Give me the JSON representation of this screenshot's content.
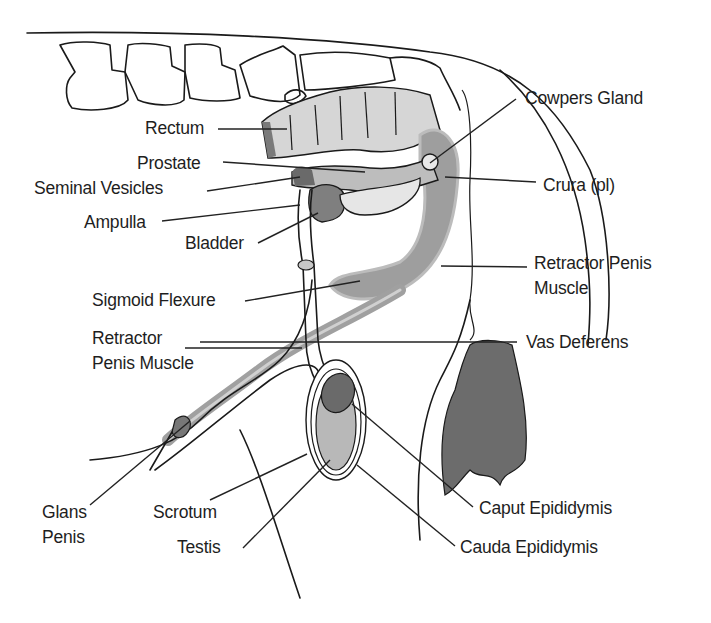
{
  "diagram": {
    "colors": {
      "background": "#ffffff",
      "ink": "#1a1a1a",
      "light_tissue": "#d9d9d9",
      "mid_tissue": "#a8a8a8",
      "dark_tissue": "#6e6e6e",
      "hair": "#6a6a6a"
    },
    "labels": [
      {
        "id": "rectum",
        "text": "Rectum",
        "x": 145,
        "y": 116,
        "align": "left",
        "line": [
          218,
          129,
          287,
          129
        ]
      },
      {
        "id": "prostate",
        "text": "Prostate",
        "x": 137,
        "y": 151,
        "align": "left",
        "line": [
          223,
          162,
          365,
          172
        ]
      },
      {
        "id": "seminal-vesicles",
        "text": "Seminal Vesicles",
        "x": 34,
        "y": 176,
        "align": "left",
        "line": [
          207,
          191,
          300,
          177
        ]
      },
      {
        "id": "ampulla",
        "text": "Ampulla",
        "x": 84,
        "y": 210,
        "align": "left",
        "line": [
          162,
          221,
          300,
          205
        ]
      },
      {
        "id": "bladder",
        "text": "Bladder",
        "x": 185,
        "y": 231,
        "align": "left",
        "line": [
          258,
          243,
          318,
          213
        ]
      },
      {
        "id": "cowpers-gland",
        "text": "Cowpers Gland",
        "x": 525,
        "y": 86,
        "align": "left",
        "line": [
          516,
          99,
          430,
          163
        ]
      },
      {
        "id": "crura",
        "text": "Crura (pl)",
        "x": 543,
        "y": 173,
        "align": "left",
        "line": [
          536,
          182,
          445,
          177
        ]
      },
      {
        "id": "retractor-penis-muscle-right",
        "text": "Retractor Penis\nMuscle",
        "x": 534,
        "y": 251,
        "align": "left",
        "line": [
          527,
          267,
          441,
          266
        ]
      },
      {
        "id": "sigmoid-flexure",
        "text": "Sigmoid Flexure",
        "x": 92,
        "y": 288,
        "align": "left",
        "line": [
          245,
          301,
          360,
          281
        ]
      },
      {
        "id": "retractor-penis-muscle-left",
        "text": "Retractor\nPenis Muscle",
        "x": 92,
        "y": 326,
        "align": "left",
        "line": [
          185,
          348,
          302,
          348
        ]
      },
      {
        "id": "vas-deferens",
        "text": "Vas Deferens",
        "x": 526,
        "y": 330,
        "align": "left",
        "line": [
          517,
          342,
          200,
          342
        ]
      },
      {
        "id": "glans-penis",
        "text": "Glans\nPenis",
        "x": 42,
        "y": 500,
        "align": "left",
        "line": [
          90,
          505,
          190,
          421
        ]
      },
      {
        "id": "scrotum",
        "text": "Scrotum",
        "x": 153,
        "y": 500,
        "align": "left",
        "line": [
          210,
          500,
          307,
          454
        ]
      },
      {
        "id": "testis",
        "text": "Testis",
        "x": 177,
        "y": 535,
        "align": "left",
        "line": [
          243,
          548,
          330,
          460
        ]
      },
      {
        "id": "caput-epididymis",
        "text": "Caput Epididymis",
        "x": 479,
        "y": 496,
        "align": "left",
        "line": [
          473,
          507,
          352,
          404
        ]
      },
      {
        "id": "cauda-epididymis",
        "text": "Cauda Epididymis",
        "x": 460,
        "y": 535,
        "align": "left",
        "line": [
          455,
          546,
          357,
          465
        ]
      }
    ]
  }
}
